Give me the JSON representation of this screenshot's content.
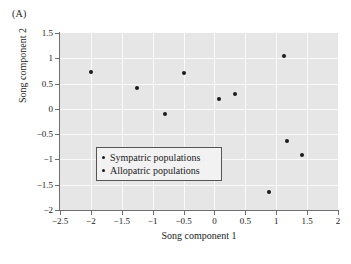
{
  "panel": {
    "label": "(A)"
  },
  "chart_data": {
    "type": "scatter",
    "title": "",
    "xlabel": "Song component 1",
    "ylabel": "Song component 2",
    "xlim": [
      -2.5,
      2
    ],
    "ylim": [
      -2,
      1.5
    ],
    "xticks": [
      -2.5,
      -2,
      -1.5,
      -1,
      -0.5,
      0,
      0.5,
      1,
      1.5,
      2
    ],
    "xticklabels": [
      "−2.5",
      "−2",
      "−1.5",
      "−1",
      "−0.5",
      "0",
      "0.5",
      "1",
      "1.5",
      "2"
    ],
    "yticks": [
      -2,
      -1.5,
      -1,
      -0.5,
      0,
      0.5,
      1,
      1.5
    ],
    "yticklabels": [
      "−2",
      "−1.5",
      "−1",
      "−0.5",
      "0",
      "0.5",
      "1",
      "1.5"
    ],
    "grid": true,
    "grid_color": "#fafafa",
    "plot_bg": "#e6e6e6",
    "marker_color": "#1b1b1b",
    "legend_position": "center-left",
    "series": [
      {
        "name": "Sympatric populations",
        "marker": "dot",
        "points": [
          {
            "x": -2.0,
            "y": 0.73
          },
          {
            "x": -1.26,
            "y": 0.41
          },
          {
            "x": -0.8,
            "y": -0.11
          },
          {
            "x": 0.88,
            "y": -1.65
          },
          {
            "x": 1.42,
            "y": -0.91
          }
        ]
      },
      {
        "name": "Allopatric populations",
        "marker": "dot",
        "points": [
          {
            "x": -0.5,
            "y": 0.7
          },
          {
            "x": 0.07,
            "y": 0.2
          },
          {
            "x": 0.33,
            "y": 0.3
          },
          {
            "x": 1.13,
            "y": 1.04
          },
          {
            "x": 1.17,
            "y": -0.64
          }
        ]
      }
    ],
    "all_points": [
      {
        "x": -2.0,
        "y": 0.73
      },
      {
        "x": -1.26,
        "y": 0.41
      },
      {
        "x": -0.8,
        "y": -0.11
      },
      {
        "x": -0.5,
        "y": 0.7
      },
      {
        "x": 0.07,
        "y": 0.2
      },
      {
        "x": 0.33,
        "y": 0.3
      },
      {
        "x": 1.13,
        "y": 1.04
      },
      {
        "x": 1.17,
        "y": -0.64
      },
      {
        "x": 1.42,
        "y": -0.91
      },
      {
        "x": 0.88,
        "y": -1.65
      }
    ],
    "legend_entries": [
      {
        "label": "Sympatric populations"
      },
      {
        "label": "Allopatric populations"
      }
    ]
  }
}
